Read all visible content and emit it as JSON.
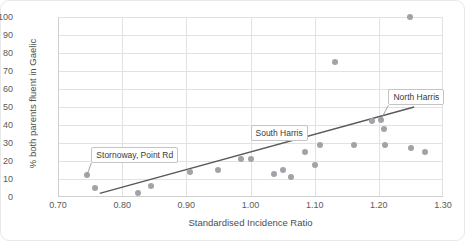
{
  "chart_data": {
    "type": "scatter",
    "title": "",
    "xlabel": "Standardised Incidence Ratio",
    "ylabel": "% both parents fluent in Gaelic",
    "xlim": [
      0.7,
      1.3
    ],
    "ylim": [
      0,
      100
    ],
    "xticks": [
      "0.70",
      "0.80",
      "0.90",
      "1.00",
      "1.10",
      "1.20",
      "1.30"
    ],
    "xtick_values": [
      0.7,
      0.8,
      0.9,
      1.0,
      1.1,
      1.2,
      1.3
    ],
    "yticks": [
      "0",
      "10",
      "20",
      "30",
      "40",
      "50",
      "60",
      "70",
      "80",
      "90",
      "100"
    ],
    "ytick_values": [
      0,
      10,
      20,
      30,
      40,
      50,
      60,
      70,
      80,
      90,
      100
    ],
    "grid": true,
    "legend": false,
    "marker_color": "#a2a2a8",
    "trendline_color": "#595959",
    "points": [
      {
        "x": 0.745,
        "y": 12
      },
      {
        "x": 0.757,
        "y": 5
      },
      {
        "x": 0.787,
        "y": 21
      },
      {
        "x": 0.824,
        "y": 2
      },
      {
        "x": 0.845,
        "y": 6
      },
      {
        "x": 0.876,
        "y": 22
      },
      {
        "x": 0.906,
        "y": 14
      },
      {
        "x": 0.95,
        "y": 15
      },
      {
        "x": 0.985,
        "y": 21
      },
      {
        "x": 1.0,
        "y": 21
      },
      {
        "x": 1.037,
        "y": 13
      },
      {
        "x": 1.05,
        "y": 15
      },
      {
        "x": 1.063,
        "y": 11
      },
      {
        "x": 1.072,
        "y": 36
      },
      {
        "x": 1.085,
        "y": 25
      },
      {
        "x": 1.1,
        "y": 18
      },
      {
        "x": 1.108,
        "y": 29
      },
      {
        "x": 1.131,
        "y": 75
      },
      {
        "x": 1.162,
        "y": 29
      },
      {
        "x": 1.19,
        "y": 42
      },
      {
        "x": 1.203,
        "y": 43
      },
      {
        "x": 1.208,
        "y": 38
      },
      {
        "x": 1.21,
        "y": 29
      },
      {
        "x": 1.248,
        "y": 100
      },
      {
        "x": 1.25,
        "y": 27
      },
      {
        "x": 1.272,
        "y": 25
      }
    ],
    "trendline": {
      "x1": 0.765,
      "y1": 2,
      "x2": 1.255,
      "y2": 50
    },
    "annotations": [
      {
        "label": "Stornoway, Point Rd",
        "point_x": 0.745,
        "point_y": 12,
        "box_x": 0.752,
        "box_y": 24
      },
      {
        "label": "South Harris",
        "point_x": 1.072,
        "point_y": 36,
        "box_x": 1.0,
        "box_y": 36
      },
      {
        "label": "North Harris",
        "point_x": 1.203,
        "point_y": 43,
        "box_x": 1.215,
        "box_y": 56
      }
    ]
  }
}
